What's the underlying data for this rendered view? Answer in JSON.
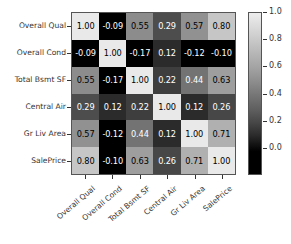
{
  "chart_data": {
    "type": "heatmap",
    "title": "",
    "xlabel": "",
    "ylabel": "",
    "categories": [
      "Overall Qual",
      "Overall Cond",
      "Total Bsmt SF",
      "Central Air",
      "Gr Liv Area",
      "SalePrice"
    ],
    "x_tick_labels": [
      "Overall Qual",
      "Overall Cond",
      "Total Bsmt SF",
      "Central Air",
      "Gr Liv Area",
      "SalePrice"
    ],
    "y_tick_labels": [
      "Overall Qual",
      "Overall Cond",
      "Total Bsmt SF",
      "Central Air",
      "Gr Liv Area",
      "SalePrice"
    ],
    "annotated": true,
    "grid": false,
    "colormap": "gray",
    "colorbar": {
      "position": "right",
      "vmin": 0.0,
      "vmax": 1.0,
      "ticks": [
        1.0,
        0.8,
        0.6,
        0.4,
        0.2,
        0.0
      ],
      "tick_labels": [
        "1.0",
        "0.8",
        "0.6",
        "0.4",
        "0.2",
        "0.0"
      ]
    },
    "rows": [
      {
        "label": "Overall Qual",
        "values": [
          1.0,
          -0.09,
          0.55,
          0.29,
          0.57,
          0.8
        ],
        "cells": [
          {
            "text": "1.00",
            "value": 1.0,
            "bg": "#e9e9e9",
            "fg": "#000000"
          },
          {
            "text": "-0.09",
            "value": -0.09,
            "bg": "#000000",
            "fg": "#ffffff"
          },
          {
            "text": "0.55",
            "value": 0.55,
            "bg": "#8c8c8c",
            "fg": "#000000"
          },
          {
            "text": "0.29",
            "value": 0.29,
            "bg": "#4d4d4d",
            "fg": "#ffffff"
          },
          {
            "text": "0.57",
            "value": 0.57,
            "bg": "#919191",
            "fg": "#000000"
          },
          {
            "text": "0.80",
            "value": 0.8,
            "bg": "#c6c6c6",
            "fg": "#000000"
          }
        ]
      },
      {
        "label": "Overall Cond",
        "values": [
          -0.09,
          1.0,
          -0.17,
          0.12,
          -0.12,
          -0.1
        ],
        "cells": [
          {
            "text": "-0.09",
            "value": -0.09,
            "bg": "#000000",
            "fg": "#ffffff"
          },
          {
            "text": "1.00",
            "value": 1.0,
            "bg": "#e9e9e9",
            "fg": "#000000"
          },
          {
            "text": "-0.17",
            "value": -0.17,
            "bg": "#000000",
            "fg": "#ffffff"
          },
          {
            "text": "0.12",
            "value": 0.12,
            "bg": "#2b2b2b",
            "fg": "#ffffff"
          },
          {
            "text": "-0.12",
            "value": -0.12,
            "bg": "#000000",
            "fg": "#ffffff"
          },
          {
            "text": "-0.10",
            "value": -0.1,
            "bg": "#000000",
            "fg": "#ffffff"
          }
        ]
      },
      {
        "label": "Total Bsmt SF",
        "values": [
          0.55,
          -0.17,
          1.0,
          0.22,
          0.44,
          0.63
        ],
        "cells": [
          {
            "text": "0.55",
            "value": 0.55,
            "bg": "#8c8c8c",
            "fg": "#000000"
          },
          {
            "text": "-0.17",
            "value": -0.17,
            "bg": "#000000",
            "fg": "#ffffff"
          },
          {
            "text": "1.00",
            "value": 1.0,
            "bg": "#e9e9e9",
            "fg": "#000000"
          },
          {
            "text": "0.22",
            "value": 0.22,
            "bg": "#3e3e3e",
            "fg": "#ffffff"
          },
          {
            "text": "0.44",
            "value": 0.44,
            "bg": "#737373",
            "fg": "#ffffff"
          },
          {
            "text": "0.63",
            "value": 0.63,
            "bg": "#9e9e9e",
            "fg": "#000000"
          }
        ]
      },
      {
        "label": "Central Air",
        "values": [
          0.29,
          0.12,
          0.22,
          1.0,
          0.12,
          0.26
        ],
        "cells": [
          {
            "text": "0.29",
            "value": 0.29,
            "bg": "#4d4d4d",
            "fg": "#ffffff"
          },
          {
            "text": "0.12",
            "value": 0.12,
            "bg": "#2b2b2b",
            "fg": "#ffffff"
          },
          {
            "text": "0.22",
            "value": 0.22,
            "bg": "#3e3e3e",
            "fg": "#ffffff"
          },
          {
            "text": "1.00",
            "value": 1.0,
            "bg": "#e9e9e9",
            "fg": "#000000"
          },
          {
            "text": "0.12",
            "value": 0.12,
            "bg": "#2b2b2b",
            "fg": "#ffffff"
          },
          {
            "text": "0.26",
            "value": 0.26,
            "bg": "#474747",
            "fg": "#ffffff"
          }
        ]
      },
      {
        "label": "Gr Liv Area",
        "values": [
          0.57,
          -0.12,
          0.44,
          0.12,
          1.0,
          0.71
        ],
        "cells": [
          {
            "text": "0.57",
            "value": 0.57,
            "bg": "#919191",
            "fg": "#000000"
          },
          {
            "text": "-0.12",
            "value": -0.12,
            "bg": "#000000",
            "fg": "#ffffff"
          },
          {
            "text": "0.44",
            "value": 0.44,
            "bg": "#737373",
            "fg": "#ffffff"
          },
          {
            "text": "0.12",
            "value": 0.12,
            "bg": "#2b2b2b",
            "fg": "#ffffff"
          },
          {
            "text": "1.00",
            "value": 1.0,
            "bg": "#e9e9e9",
            "fg": "#000000"
          },
          {
            "text": "0.71",
            "value": 0.71,
            "bg": "#b0b0b0",
            "fg": "#000000"
          }
        ]
      },
      {
        "label": "SalePrice",
        "values": [
          0.8,
          -0.1,
          0.63,
          0.26,
          0.71,
          1.0
        ],
        "cells": [
          {
            "text": "0.80",
            "value": 0.8,
            "bg": "#c6c6c6",
            "fg": "#000000"
          },
          {
            "text": "-0.10",
            "value": -0.1,
            "bg": "#000000",
            "fg": "#ffffff"
          },
          {
            "text": "0.63",
            "value": 0.63,
            "bg": "#9e9e9e",
            "fg": "#000000"
          },
          {
            "text": "0.26",
            "value": 0.26,
            "bg": "#474747",
            "fg": "#ffffff"
          },
          {
            "text": "0.71",
            "value": 0.71,
            "bg": "#b0b0b0",
            "fg": "#000000"
          },
          {
            "text": "1.00",
            "value": 1.0,
            "bg": "#e9e9e9",
            "fg": "#000000"
          }
        ]
      }
    ]
  }
}
